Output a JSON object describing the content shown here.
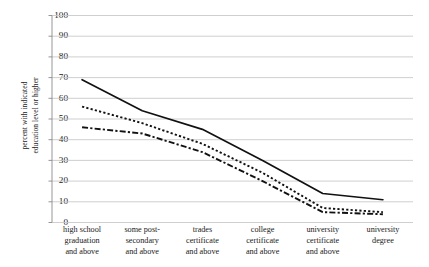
{
  "chart_data": {
    "type": "line",
    "title": "",
    "xlabel": "",
    "ylabel": "percent with indicated education level or higher",
    "ylabel_lines": [
      "percent with indicated",
      "education level or higher"
    ],
    "categories": [
      "high school graduation and above",
      "some post-secondary and above",
      "trades certificate and above",
      "college certificate and above",
      "university certificate and above",
      "university degree"
    ],
    "category_lines": [
      [
        "high school",
        "graduation",
        "and above"
      ],
      [
        "some post-",
        "secondary",
        "and above"
      ],
      [
        "trades",
        "certificate",
        "and above"
      ],
      [
        "college",
        "certificate",
        "and above"
      ],
      [
        "university",
        "certificate",
        "and above"
      ],
      [
        "university",
        "degree"
      ]
    ],
    "ylim": [
      0,
      100
    ],
    "yticks": [
      0,
      10,
      20,
      30,
      40,
      50,
      60,
      70,
      80,
      90,
      100
    ],
    "grid": true,
    "legend": false,
    "series": [
      {
        "name": "series-solid",
        "style": "solid",
        "values": [
          69,
          54,
          45,
          30,
          14,
          11
        ]
      },
      {
        "name": "series-dotted",
        "style": "dotted",
        "values": [
          56,
          48,
          38,
          24,
          7,
          5
        ]
      },
      {
        "name": "series-dashdot",
        "style": "dashdot",
        "values": [
          46,
          43,
          34,
          20,
          5,
          4
        ]
      }
    ],
    "colors": {
      "line": "#111111",
      "grid": "#c9c9c9",
      "axis": "#8a8a8a",
      "background": "#ffffff"
    }
  }
}
